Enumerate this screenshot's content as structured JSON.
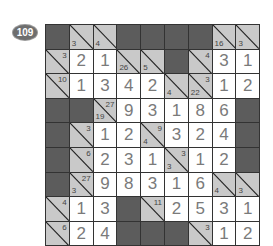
{
  "puzzle_number": "109",
  "colors": {
    "blocked": "#5c5c5c",
    "clue": "#c9c9c9",
    "entry": "#ffffff",
    "digit": "#7a7a7a"
  },
  "grid": [
    [
      {
        "t": "D"
      },
      {
        "t": "C",
        "down": "3"
      },
      {
        "t": "C",
        "down": "4"
      },
      {
        "t": "D"
      },
      {
        "t": "D"
      },
      {
        "t": "D"
      },
      {
        "t": "D"
      },
      {
        "t": "C",
        "down": "16"
      },
      {
        "t": "C",
        "down": "3"
      }
    ],
    [
      {
        "t": "C",
        "across": "3"
      },
      {
        "t": "W",
        "v": "2"
      },
      {
        "t": "W",
        "v": "1"
      },
      {
        "t": "C",
        "down": "26"
      },
      {
        "t": "C",
        "down": "5"
      },
      {
        "t": "D"
      },
      {
        "t": "C",
        "across": "4"
      },
      {
        "t": "W",
        "v": "3"
      },
      {
        "t": "W",
        "v": "1"
      }
    ],
    [
      {
        "t": "C",
        "across": "10"
      },
      {
        "t": "W",
        "v": "1"
      },
      {
        "t": "W",
        "v": "3"
      },
      {
        "t": "W",
        "v": "4"
      },
      {
        "t": "W",
        "v": "2"
      },
      {
        "t": "C",
        "down": "4"
      },
      {
        "t": "C",
        "down": "22",
        "across": "3"
      },
      {
        "t": "W",
        "v": "1"
      },
      {
        "t": "W",
        "v": "2"
      }
    ],
    [
      {
        "t": "D"
      },
      {
        "t": "D"
      },
      {
        "t": "C",
        "down": "19",
        "across": "27"
      },
      {
        "t": "W",
        "v": "9"
      },
      {
        "t": "W",
        "v": "3"
      },
      {
        "t": "W",
        "v": "1"
      },
      {
        "t": "W",
        "v": "8"
      },
      {
        "t": "W",
        "v": "6"
      },
      {
        "t": "D"
      }
    ],
    [
      {
        "t": "D"
      },
      {
        "t": "C",
        "across": "3"
      },
      {
        "t": "W",
        "v": "1"
      },
      {
        "t": "W",
        "v": "2"
      },
      {
        "t": "C",
        "down": "4",
        "across": "9"
      },
      {
        "t": "W",
        "v": "3"
      },
      {
        "t": "W",
        "v": "2"
      },
      {
        "t": "W",
        "v": "4"
      },
      {
        "t": "D"
      }
    ],
    [
      {
        "t": "D"
      },
      {
        "t": "C",
        "across": "6"
      },
      {
        "t": "W",
        "v": "2"
      },
      {
        "t": "W",
        "v": "3"
      },
      {
        "t": "W",
        "v": "1"
      },
      {
        "t": "C",
        "down": "3",
        "across": "3"
      },
      {
        "t": "W",
        "v": "1"
      },
      {
        "t": "W",
        "v": "2"
      },
      {
        "t": "D"
      }
    ],
    [
      {
        "t": "D"
      },
      {
        "t": "C",
        "down": "3",
        "across": "27"
      },
      {
        "t": "W",
        "v": "9"
      },
      {
        "t": "W",
        "v": "8"
      },
      {
        "t": "W",
        "v": "3"
      },
      {
        "t": "W",
        "v": "1"
      },
      {
        "t": "W",
        "v": "6"
      },
      {
        "t": "C",
        "down": "4"
      },
      {
        "t": "C",
        "down": "3"
      }
    ],
    [
      {
        "t": "C",
        "across": "4"
      },
      {
        "t": "W",
        "v": "1"
      },
      {
        "t": "W",
        "v": "3"
      },
      {
        "t": "D"
      },
      {
        "t": "C",
        "across": "11"
      },
      {
        "t": "W",
        "v": "2"
      },
      {
        "t": "W",
        "v": "5"
      },
      {
        "t": "W",
        "v": "3"
      },
      {
        "t": "W",
        "v": "1"
      }
    ],
    [
      {
        "t": "C",
        "across": "6"
      },
      {
        "t": "W",
        "v": "2"
      },
      {
        "t": "W",
        "v": "4"
      },
      {
        "t": "D"
      },
      {
        "t": "D"
      },
      {
        "t": "D"
      },
      {
        "t": "C",
        "across": "3"
      },
      {
        "t": "W",
        "v": "1"
      },
      {
        "t": "W",
        "v": "2"
      }
    ]
  ]
}
